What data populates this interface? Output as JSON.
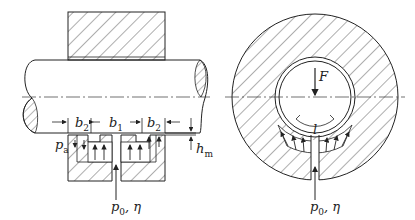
{
  "diagram": {
    "left_view": {
      "labels": {
        "b2_left": "b",
        "b2_left_sub": "2",
        "b1": "b",
        "b1_sub": "1",
        "b2_right": "b",
        "b2_right_sub": "2",
        "pa": "p",
        "pa_sub": "a",
        "hm": "h",
        "hm_sub": "m",
        "supply": "p",
        "supply_sub": "0",
        "supply_eta": ", η"
      }
    },
    "right_view": {
      "labels": {
        "force": "F",
        "l": "l",
        "supply": "p",
        "supply_sub": "0",
        "supply_eta": ", η"
      }
    },
    "colors": {
      "line": "#222222",
      "hatch": "#333333",
      "background": "#ffffff"
    }
  }
}
